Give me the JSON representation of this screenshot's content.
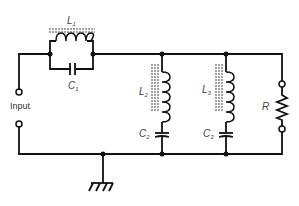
{
  "diagram": {
    "type": "circuit-schematic",
    "components": {
      "L1": {
        "symbol": "L",
        "sub": "1"
      },
      "C1": {
        "symbol": "C",
        "sub": "1"
      },
      "L2": {
        "symbol": "L",
        "sub": "2"
      },
      "C2": {
        "symbol": "C",
        "sub": "2"
      },
      "L3": {
        "symbol": "L",
        "sub": "3"
      },
      "C3": {
        "symbol": "C",
        "sub": "3"
      },
      "R": {
        "symbol": "R"
      }
    },
    "input_label": "Input",
    "colors": {
      "wire": "#111111",
      "label": "#444444",
      "background": "#ffffff"
    }
  }
}
